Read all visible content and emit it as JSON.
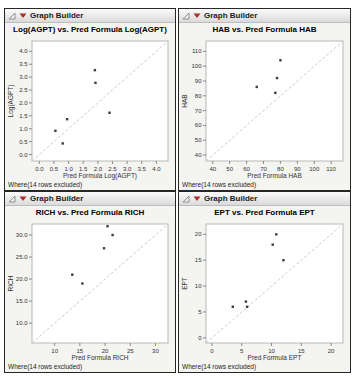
{
  "panels": [
    {
      "header": "Graph Builder",
      "footer": "Where(14 rows excluded)"
    },
    {
      "header": "Graph Builder",
      "footer": "Where(14 rows excluded)"
    },
    {
      "header": "Graph Builder",
      "footer": "Where(14 rows excluded)"
    },
    {
      "header": "Graph Builder",
      "footer": "Where(14 rows excluded)"
    }
  ],
  "colors": {
    "frame": "#b8b8b8",
    "identity_line": "#cccccc",
    "point": "#3d3d3d",
    "tick": "#8a8a8a",
    "text": "#333333",
    "red_triangle": "#a92f27",
    "disclosure_gray": "#8f8f8f"
  },
  "chart_data": [
    {
      "type": "scatter",
      "title": "Log(AGPT) vs. Pred Formula Log(AGPT)",
      "xlabel": "Pred Formula Log(AGPT)",
      "ylabel": "Log(AGPT)",
      "xlim": [
        -0.25,
        4.4
      ],
      "ylim": [
        -0.25,
        4.4
      ],
      "xticks": [
        0.0,
        0.5,
        1.0,
        1.5,
        2.0,
        2.5,
        3.0,
        3.5,
        4.0
      ],
      "xtick_labels": [
        "0.0",
        "0.5",
        "1.0",
        "1.5",
        "2.0",
        "2.5",
        "3.0",
        "3.5",
        "4.0"
      ],
      "yticks": [
        0.0,
        0.5,
        1.0,
        1.5,
        2.0,
        2.5,
        3.0,
        3.5,
        4.0
      ],
      "ytick_labels": [
        "0.0",
        "0.5",
        "1.0",
        "1.5",
        "2.0",
        "2.5",
        "3.0",
        "3.5",
        "4.0"
      ],
      "points": [
        [
          0.55,
          0.92
        ],
        [
          0.8,
          0.43
        ],
        [
          0.95,
          1.37
        ],
        [
          1.9,
          3.27
        ],
        [
          1.92,
          2.78
        ],
        [
          2.4,
          1.62
        ]
      ],
      "identity_line": true,
      "grid": false
    },
    {
      "type": "scatter",
      "title": "HAB vs. Pred Formula HAB",
      "xlabel": "Pred Formula HAB",
      "ylabel": "HAB",
      "xlim": [
        36,
        117
      ],
      "ylim": [
        36,
        117
      ],
      "xticks": [
        40,
        50,
        60,
        70,
        80,
        90,
        100,
        110
      ],
      "xtick_labels": [
        "40",
        "50",
        "60",
        "70",
        "80",
        "90",
        "100",
        "110"
      ],
      "yticks": [
        40,
        50,
        60,
        70,
        80,
        90,
        100,
        110
      ],
      "ytick_labels": [
        "40",
        "50",
        "60",
        "70",
        "80",
        "90",
        "100",
        "110"
      ],
      "points": [
        [
          66,
          86
        ],
        [
          80,
          104
        ],
        [
          78,
          92
        ],
        [
          77,
          82
        ]
      ],
      "identity_line": true,
      "grid": false
    },
    {
      "type": "scatter",
      "title": "RICH vs. Pred Formula RICH",
      "xlabel": "Pred Formula RICH",
      "ylabel": "RICH",
      "xlim": [
        5.5,
        32.5
      ],
      "ylim": [
        5.5,
        32.5
      ],
      "xticks": [
        10,
        15,
        20,
        25,
        30
      ],
      "xtick_labels": [
        "10",
        "15",
        "20",
        "25",
        "30"
      ],
      "yticks": [
        10,
        15,
        20,
        25,
        30
      ],
      "ytick_labels": [
        "10.0",
        "15.0",
        "20.0",
        "25.0",
        "30.0"
      ],
      "points": [
        [
          13.5,
          21
        ],
        [
          15.5,
          19
        ],
        [
          19.8,
          27
        ],
        [
          20.5,
          32
        ],
        [
          21.5,
          30
        ]
      ],
      "identity_line": true,
      "grid": false
    },
    {
      "type": "scatter",
      "title": "EPT vs. Pred Formula EPT",
      "xlabel": "Pred Formula EPT",
      "ylabel": "EPT",
      "xlim": [
        -1,
        22
      ],
      "ylim": [
        -1,
        22
      ],
      "xticks": [
        0,
        5,
        10,
        15,
        20
      ],
      "xtick_labels": [
        "0",
        "5",
        "10",
        "15",
        "20"
      ],
      "yticks": [
        0,
        5,
        10,
        15,
        20
      ],
      "ytick_labels": [
        "0",
        "5",
        "10",
        "15",
        "20"
      ],
      "points": [
        [
          3.5,
          6
        ],
        [
          5.7,
          7
        ],
        [
          5.9,
          6
        ],
        [
          10.2,
          18
        ],
        [
          10.8,
          20
        ],
        [
          12,
          15
        ]
      ],
      "identity_line": true,
      "grid": false
    }
  ]
}
